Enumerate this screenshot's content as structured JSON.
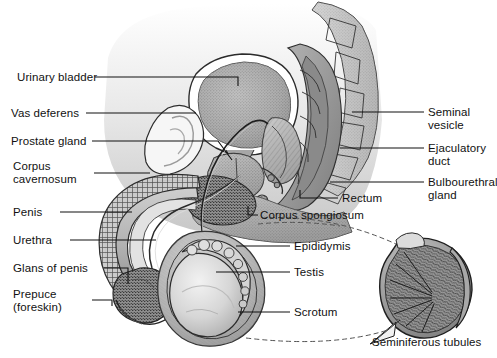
{
  "figure": {
    "background": "#ffffff",
    "ink": "#111111",
    "width": 497,
    "height": 358
  },
  "labels": {
    "urinary_bladder": "Urinary bladder",
    "vas_deferens": "Vas deferens",
    "prostate_gland": "Prostate gland",
    "corpus_cavernosum_l1": "Corpus",
    "corpus_cavernosum_l2": "cavernosum",
    "penis": "Penis",
    "urethra": "Urethra",
    "glans_of_penis": "Glans of penis",
    "prepuce_l1": "Prepuce",
    "prepuce_l2": "(foreskin)",
    "seminal_vesicle_l1": "Seminal",
    "seminal_vesicle_l2": "vesicle",
    "ejaculatory_duct_l1": "Ejaculatory",
    "ejaculatory_duct_l2": "duct",
    "bulbourethral_gland_l1": "Bulbourethral",
    "bulbourethral_gland_l2": "gland",
    "rectum": "Rectum",
    "corpus_spongiosum": "Corpus spongiosum",
    "epididymis": "Epididymis",
    "testis": "Testis",
    "scrotum": "Scrotum",
    "seminiferous_tubules": "Seminiferous tubules"
  },
  "parts": {
    "left_column": [
      "Urinary bladder",
      "Vas deferens",
      "Prostate gland",
      "Corpus cavernosum",
      "Penis",
      "Urethra",
      "Glans of penis",
      "Prepuce (foreskin)"
    ],
    "right_column": [
      "Seminal vesicle",
      "Ejaculatory duct",
      "Bulbourethral gland",
      "Rectum"
    ],
    "interior_callouts": [
      "Corpus spongiosum",
      "Epididymis",
      "Testis",
      "Scrotum"
    ],
    "inset_callouts": [
      "Seminiferous tubules"
    ]
  },
  "inset": {
    "name": "testis-cross-section",
    "description": "magnified cut-away of testis showing seminiferous tubules"
  }
}
